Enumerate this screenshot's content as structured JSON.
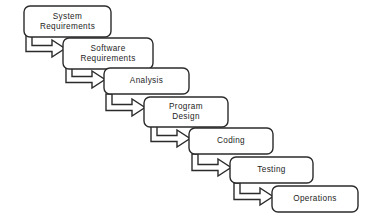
{
  "diagram": {
    "background_color": "#ffffff",
    "box_fill_color": "#ffffff",
    "box_stroke_color": "#2b2b2b",
    "arrow_fill_color": "#ffffff",
    "arrow_stroke_color": "#2b2b2b",
    "text_color": "#1d1d1d",
    "stages": [
      {
        "id": "system-requirements",
        "label_lines": [
          "System",
          "Requirements"
        ],
        "label": "System Requirements",
        "x": 24,
        "y": 6,
        "width": 87,
        "height": 31
      },
      {
        "id": "software-requirements",
        "label_lines": [
          "Software",
          "Requirements"
        ],
        "label": "Software Requirements",
        "x": 63,
        "y": 38,
        "width": 90,
        "height": 31
      },
      {
        "id": "analysis",
        "label_lines": [
          "Analysis"
        ],
        "label": "Analysis",
        "x": 104,
        "y": 68,
        "width": 85,
        "height": 26
      },
      {
        "id": "program-design",
        "label_lines": [
          "Program",
          "Design"
        ],
        "label": "Program Design",
        "x": 144,
        "y": 97,
        "width": 84,
        "height": 30
      },
      {
        "id": "coding",
        "label_lines": [
          "Coding"
        ],
        "label": "Coding",
        "x": 189,
        "y": 128,
        "width": 84,
        "height": 26
      },
      {
        "id": "testing",
        "label_lines": [
          "Testing"
        ],
        "label": "Testing",
        "x": 230,
        "y": 157,
        "width": 83,
        "height": 26
      },
      {
        "id": "operations",
        "label_lines": [
          "Operations"
        ],
        "label": "Operations",
        "x": 272,
        "y": 186,
        "width": 86,
        "height": 26
      }
    ],
    "arrows": [
      {
        "id": "arrow-system-to-software",
        "from": "system-requirements",
        "to": "software-requirements",
        "x": 26,
        "y": 35,
        "width": 39,
        "height": 22
      },
      {
        "id": "arrow-software-to-analysis",
        "from": "software-requirements",
        "to": "analysis",
        "x": 66,
        "y": 66,
        "width": 39,
        "height": 22
      },
      {
        "id": "arrow-analysis-to-program-design",
        "from": "analysis",
        "to": "program-design",
        "x": 106,
        "y": 94,
        "width": 39,
        "height": 22
      },
      {
        "id": "arrow-program-design-to-coding",
        "from": "program-design",
        "to": "coding",
        "x": 151,
        "y": 125,
        "width": 39,
        "height": 22
      },
      {
        "id": "arrow-coding-to-testing",
        "from": "coding",
        "to": "testing",
        "x": 192,
        "y": 154,
        "width": 39,
        "height": 22
      },
      {
        "id": "arrow-testing-to-operations",
        "from": "testing",
        "to": "operations",
        "x": 234,
        "y": 183,
        "width": 39,
        "height": 22
      }
    ]
  }
}
